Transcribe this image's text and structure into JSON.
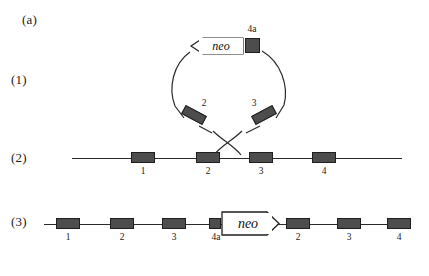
{
  "figure": {
    "panel_label": "(a)",
    "rows": [
      {
        "id": "row1",
        "label": "(1)"
      },
      {
        "id": "row2",
        "label": "(2)"
      },
      {
        "id": "row3",
        "label": "(3)"
      }
    ]
  },
  "targeting_vector": {
    "description": "circular-plasmid",
    "cassette_label": "neo",
    "cassette_orientation": "left-pointing-arrow",
    "homology_arm_labels": [
      "4a",
      "2",
      "3"
    ],
    "arm_4a_label": "4a",
    "arm_2_label": "2",
    "arm_3_label": "3"
  },
  "crossover": {
    "symbol": "X",
    "description": "double-crossover-recombination"
  },
  "endogenous_locus": {
    "exon_labels": [
      "1",
      "2",
      "3",
      "4"
    ]
  },
  "targeted_locus": {
    "element_labels": [
      "1",
      "2",
      "3",
      "4a",
      "neo",
      "2",
      "3",
      "4"
    ],
    "cassette_label": "neo",
    "cassette_orientation": "right-pointing-arrow"
  },
  "colors": {
    "exon_fill": "#4d4d4d",
    "exon_stroke": "#1f1f1f",
    "line": "#2a2a2a",
    "text": "#222222",
    "background": "#ffffff"
  }
}
